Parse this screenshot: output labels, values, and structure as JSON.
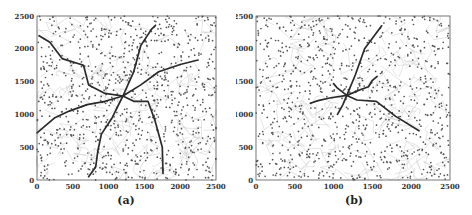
{
  "chart_data": [
    {
      "type": "scatter",
      "panel_label": "(a)",
      "title": "",
      "xlabel": "",
      "ylabel": "",
      "xlim": [
        0,
        2500
      ],
      "ylim": [
        0,
        2500
      ],
      "x_ticks": [
        "0",
        "500",
        "1000",
        "1500",
        "2000",
        "2500"
      ],
      "y_ticks": [
        "0",
        "500",
        "1000",
        "1500",
        "2000",
        "2500"
      ],
      "grid": false,
      "legend": null,
      "series": [
        {
          "name": "nodes",
          "kind": "points",
          "approx_count": 900,
          "seed": 11
        },
        {
          "name": "thin-links",
          "kind": "thin-lines",
          "approx_count": 140,
          "seed": 21
        },
        {
          "name": "route-nw",
          "kind": "thick-path",
          "points": [
            [
              30,
              2200
            ],
            [
              180,
              2100
            ],
            [
              350,
              1850
            ],
            [
              650,
              1750
            ],
            [
              720,
              1450
            ],
            [
              950,
              1320
            ],
            [
              1200,
              1280
            ]
          ]
        },
        {
          "name": "route-n",
          "kind": "thick-path",
          "points": [
            [
              1200,
              1280
            ],
            [
              1350,
              1650
            ],
            [
              1450,
              2050
            ],
            [
              1600,
              2300
            ],
            [
              1650,
              2350
            ]
          ]
        },
        {
          "name": "route-ne",
          "kind": "thick-path",
          "points": [
            [
              1200,
              1280
            ],
            [
              1450,
              1450
            ],
            [
              1700,
              1650
            ],
            [
              2000,
              1760
            ],
            [
              2250,
              1830
            ]
          ]
        },
        {
          "name": "route-se",
          "kind": "thick-path",
          "points": [
            [
              1200,
              1280
            ],
            [
              1350,
              1200
            ],
            [
              1550,
              1200
            ],
            [
              1650,
              900
            ],
            [
              1750,
              500
            ],
            [
              1760,
              100
            ]
          ]
        },
        {
          "name": "route-s",
          "kind": "thick-path",
          "points": [
            [
              1200,
              1280
            ],
            [
              1050,
              950
            ],
            [
              900,
              700
            ],
            [
              850,
              450
            ],
            [
              820,
              200
            ],
            [
              720,
              50
            ]
          ]
        },
        {
          "name": "route-w",
          "kind": "thick-path",
          "points": [
            [
              1200,
              1280
            ],
            [
              950,
              1200
            ],
            [
              700,
              1150
            ],
            [
              450,
              1050
            ],
            [
              250,
              950
            ],
            [
              0,
              720
            ]
          ]
        }
      ]
    },
    {
      "type": "scatter",
      "panel_label": "(b)",
      "title": "",
      "xlabel": "",
      "ylabel": "",
      "xlim": [
        0,
        2500
      ],
      "ylim": [
        0,
        2500
      ],
      "x_ticks": [
        "0",
        "500",
        "1000",
        "1500",
        "2000",
        "2500"
      ],
      "y_ticks": [
        "0",
        "500",
        "1000",
        "1500",
        "2000",
        "2500"
      ],
      "grid": false,
      "legend": null,
      "series": [
        {
          "name": "nodes",
          "kind": "points",
          "approx_count": 900,
          "seed": 47
        },
        {
          "name": "thin-links",
          "kind": "thin-lines",
          "approx_count": 140,
          "seed": 53
        },
        {
          "name": "route-n",
          "kind": "thick-path",
          "points": [
            [
              1170,
              1290
            ],
            [
              1280,
              1600
            ],
            [
              1400,
              2000
            ],
            [
              1620,
              2350
            ]
          ]
        },
        {
          "name": "route-ne",
          "kind": "thick-path",
          "points": [
            [
              1170,
              1290
            ],
            [
              1350,
              1380
            ],
            [
              1450,
              1420
            ],
            [
              1500,
              1520
            ],
            [
              1560,
              1580
            ]
          ]
        },
        {
          "name": "route-nw",
          "kind": "thick-path",
          "points": [
            [
              1170,
              1290
            ],
            [
              1050,
              1400
            ],
            [
              1000,
              1470
            ]
          ]
        },
        {
          "name": "route-w",
          "kind": "thick-path",
          "points": [
            [
              1170,
              1290
            ],
            [
              950,
              1250
            ],
            [
              800,
              1210
            ],
            [
              700,
              1170
            ]
          ]
        },
        {
          "name": "route-s",
          "kind": "thick-path",
          "points": [
            [
              1170,
              1290
            ],
            [
              1120,
              1150
            ],
            [
              1050,
              1000
            ]
          ]
        },
        {
          "name": "route-se",
          "kind": "thick-path",
          "points": [
            [
              1170,
              1290
            ],
            [
              1300,
              1220
            ],
            [
              1550,
              1200
            ],
            [
              1800,
              970
            ],
            [
              2100,
              750
            ]
          ]
        }
      ]
    }
  ],
  "panels": [
    {
      "label": "(a)",
      "plot": {
        "left": 37,
        "top": 16,
        "right": 216,
        "bottom": 180
      },
      "caption_x": 126,
      "caption_y": 204
    },
    {
      "label": "(b)",
      "plot": {
        "left": 256,
        "top": 16,
        "right": 450,
        "bottom": 180
      },
      "caption_x": 354,
      "caption_y": 204
    }
  ],
  "colors": {
    "frame": "#555555",
    "dots": "#555555",
    "thin_lines": "#bdbdbd",
    "thick_paths": "#2a2a2a",
    "text": "#333333"
  }
}
